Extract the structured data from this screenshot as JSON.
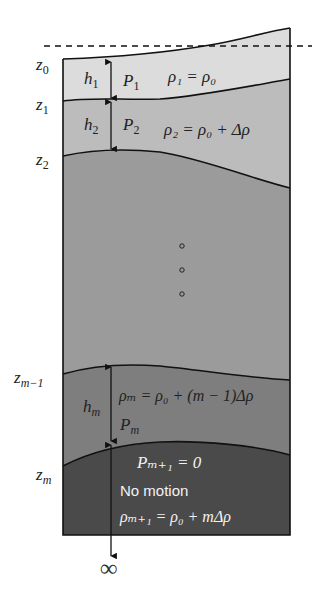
{
  "figure": {
    "colors": {
      "layer1": "#dcdcdc",
      "layer2": "#bcbcbc",
      "layer_mid": "#9b9b9b",
      "layer_m": "#7e7e7e",
      "layer_deep": "#4a4a4a",
      "line": "#111111",
      "white_text": "#f2f2f2"
    },
    "surface_line": "dashed reference level",
    "interface_labels": {
      "z0": "z",
      "z0_sub": "0",
      "z1": "z",
      "z1_sub": "1",
      "z2": "z",
      "z2_sub": "2",
      "zm1": "z",
      "zm1_sub": "m−1",
      "zm": "z",
      "zm_sub": "m"
    },
    "layers": [
      {
        "thickness": "h",
        "thickness_sub": "1",
        "pressure": "P",
        "pressure_sub": "1",
        "density": "ρ₁ = ρ₀"
      },
      {
        "thickness": "h",
        "thickness_sub": "2",
        "pressure": "P",
        "pressure_sub": "2",
        "density": "ρ₂ = ρ₀ + Δρ"
      },
      {
        "ellipsis": "∘ ∘ ∘"
      },
      {
        "thickness": "h",
        "thickness_sub": "m",
        "pressure": "P",
        "pressure_sub": "m",
        "density": "ρₘ = ρ₀ + (m − 1)Δρ"
      }
    ],
    "deep_layer": {
      "pressure": "Pₘ₊₁ = 0",
      "motion": "No motion",
      "density": "ρₘ₊₁ = ρ₀ + mΔρ"
    },
    "infinity": "∞"
  }
}
